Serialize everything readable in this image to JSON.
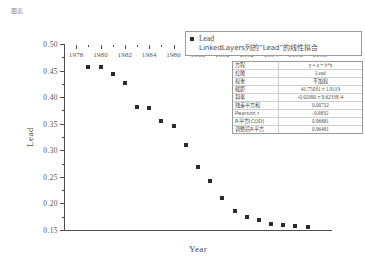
{
  "corner_caption": "图表",
  "chart_data": {
    "type": "scatter",
    "title": "",
    "xlabel": "Year",
    "ylabel": "Lead",
    "xlim": [
      1977,
      1999
    ],
    "ylim": [
      0.15,
      0.5
    ],
    "xticks": [
      1978,
      1980,
      1982,
      1984,
      1986,
      1988,
      1990,
      1992,
      1994,
      1996,
      1998
    ],
    "yticks": [
      "0.50",
      "0.45",
      "0.40",
      "0.35",
      "0.30",
      "0.25",
      "0.20",
      "0.15"
    ],
    "ytick_values": [
      0.5,
      0.45,
      0.4,
      0.35,
      0.3,
      0.25,
      0.2,
      0.15
    ],
    "x_minor_step": 1,
    "y_minor_step": 0.025,
    "grid": false,
    "legend_position": "top-right",
    "marker": "square",
    "marker_color": "#2b2b2b",
    "series": [
      {
        "name": "Lead",
        "x": [
          1979,
          1980,
          1981,
          1982,
          1983,
          1984,
          1985,
          1986,
          1987,
          1988,
          1989,
          1990,
          1991,
          1992,
          1993,
          1994,
          1995,
          1996,
          1997
        ],
        "y": [
          0.456,
          0.456,
          0.444,
          0.427,
          0.381,
          0.38,
          0.355,
          0.346,
          0.31,
          0.269,
          0.243,
          0.21,
          0.185,
          0.174,
          0.168,
          0.161,
          0.159,
          0.157,
          0.156
        ]
      }
    ]
  },
  "legend": {
    "marker_label": "Lead",
    "fit_label": "LinkedLayers列的“Lead”的线性拟合"
  },
  "stats": {
    "rows": [
      {
        "key": "方程",
        "value": "y = a + b*x"
      },
      {
        "key": "绘图",
        "value": "Lead"
      },
      {
        "key": "权重",
        "value": "不加权"
      },
      {
        "key": "截距",
        "value": "41.75031 ± 1.9119"
      },
      {
        "key": "斜率",
        "value": "-0.02090 ± 9.6233E-4"
      },
      {
        "key": "残差平方和",
        "value": "0.00722"
      },
      {
        "key": "Pearson r",
        "value": "-0.9832"
      },
      {
        "key": "R平方(COD)",
        "value": "0.96681"
      },
      {
        "key": "调整后R平方",
        "value": "0.96481"
      }
    ]
  }
}
